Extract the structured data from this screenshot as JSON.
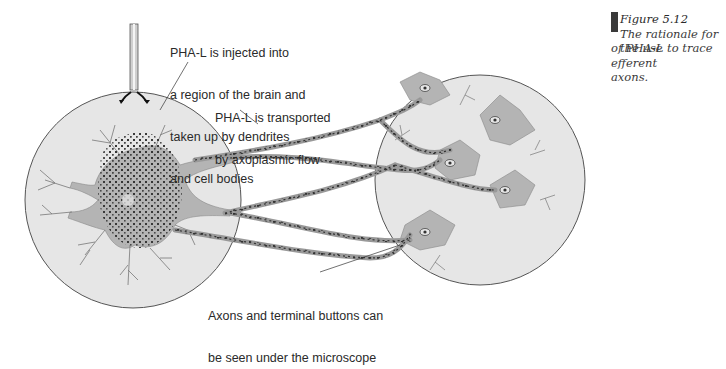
{
  "figure": {
    "caption": {
      "number": "Figure 5.12",
      "text_line1": "The rationale for the use",
      "text_line2": "of PHA-L to trace efferent",
      "text_line3": "axons."
    },
    "labels": {
      "injection": {
        "line1": "PHA-L is injected into",
        "line2": "a region of the brain and",
        "line3": "taken up by dendrites",
        "line4": "and cell bodies"
      },
      "transport": {
        "line1": "PHA-L is transported",
        "line2": "by axoplasmic flow"
      },
      "microscope": {
        "line1": "Axons and terminal buttons can",
        "line2": "be seen under the microscope"
      }
    },
    "colors": {
      "circle_fill": "#e6e6e6",
      "neuron_fill": "#b4b4b4",
      "outline": "#555555",
      "dots": "#333333",
      "caption_marker": "#3a3a3a"
    }
  }
}
